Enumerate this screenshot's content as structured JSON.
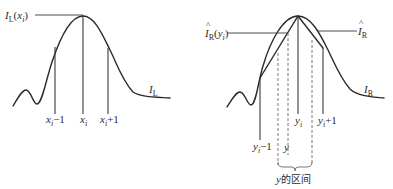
{
  "left_panel": {
    "peak_label": {
      "main": "I",
      "sub": "L",
      "arg_open": "(",
      "arg": "x",
      "arg_sub": "i",
      "arg_close": ")"
    },
    "curve_label": {
      "main": "I",
      "sub": "L"
    },
    "tick_labels": [
      {
        "main": "x",
        "sub": "i",
        "suffix": "−1"
      },
      {
        "main": "x",
        "sub": "i",
        "suffix": ""
      },
      {
        "main": "x",
        "sub": "i",
        "suffix": "+1"
      }
    ]
  },
  "right_panel": {
    "peak_label": {
      "hat": "^",
      "main": "I",
      "sub": "R",
      "arg_open": "(",
      "arg": "y",
      "arg_sub": "i",
      "arg_close": ")"
    },
    "interp_label": {
      "hat": "^",
      "main": "I",
      "sub": "R"
    },
    "curve_label": {
      "main": "I",
      "sub": "R"
    },
    "tick_labels": [
      {
        "main": "y",
        "sub": "i",
        "suffix": "−1"
      },
      {
        "main": "y",
        "sub": "",
        "suffix": ""
      },
      {
        "main": "y",
        "sub": "i",
        "suffix": ""
      },
      {
        "main": "y",
        "sub": "i",
        "suffix": "+1"
      }
    ],
    "interval_label": {
      "var": "y",
      "text": "的区间"
    }
  }
}
